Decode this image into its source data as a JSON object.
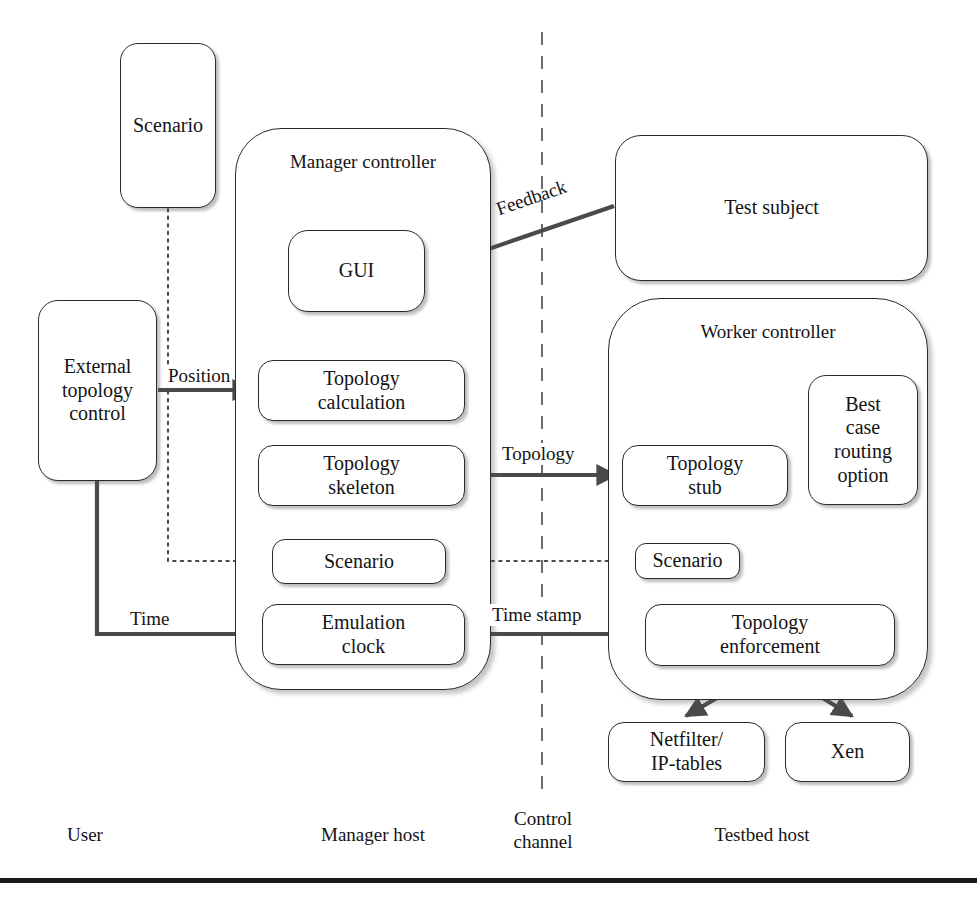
{
  "figure": {
    "type": "block-architecture-diagram",
    "width": 977,
    "height": 906,
    "stroke_color": "#2b2b2b",
    "text_color": "#141414",
    "background": "#ffffff"
  },
  "nodes": {
    "user_scenario": {
      "label": "Scenario"
    },
    "external_topology_control": {
      "label": "External\ntopology\ncontrol"
    },
    "manager_controller": {
      "label": "Manager controller"
    },
    "gui": {
      "label": "GUI"
    },
    "topology_calculation": {
      "label": "Topology\ncalculation"
    },
    "topology_skeleton": {
      "label": "Topology\nskeleton"
    },
    "manager_scenario": {
      "label": "Scenario"
    },
    "emulation_clock": {
      "label": "Emulation\nclock"
    },
    "test_subject": {
      "label": "Test subject"
    },
    "worker_controller": {
      "label": "Worker controller"
    },
    "topology_stub": {
      "label": "Topology\nstub"
    },
    "best_case_routing_option": {
      "label": "Best\ncase\nrouting\noption"
    },
    "worker_scenario": {
      "label": "Scenario"
    },
    "topology_enforcement": {
      "label": "Topology\nenforcement"
    },
    "netfilter_iptables": {
      "label": "Netfilter/\nIP-tables"
    },
    "xen": {
      "label": "Xen"
    }
  },
  "edge_labels": {
    "feedback": "Feedback",
    "position": "Position",
    "topology": "Topology",
    "time": "Time",
    "time_stamp": "Time stamp"
  },
  "zone_labels": {
    "user": "User",
    "manager_host": "Manager host",
    "control_channel": "Control\nchannel",
    "testbed_host": "Testbed host"
  }
}
